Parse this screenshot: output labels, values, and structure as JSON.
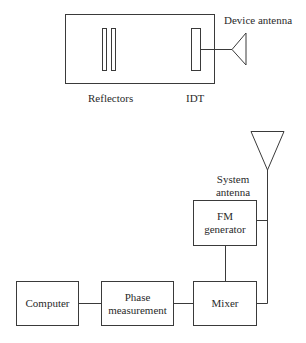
{
  "top_diagram": {
    "device_antenna_label": "Device antenna",
    "reflectors_label": "Reflectors",
    "idt_label": "IDT"
  },
  "bottom_diagram": {
    "system_antenna_label_line1": "System",
    "system_antenna_label_line2": "antenna",
    "fm_generator_line1": "FM",
    "fm_generator_line2": "generator",
    "computer_label": "Computer",
    "phase_measurement_line1": "Phase",
    "phase_measurement_line2": "measurement",
    "mixer_label": "Mixer"
  },
  "colors": {
    "stroke": "#3a3a3a",
    "background": "#ffffff"
  }
}
